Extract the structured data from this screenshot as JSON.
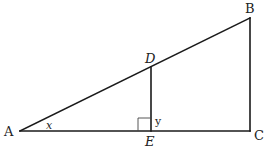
{
  "diagram": {
    "points": {
      "A": {
        "label": "A",
        "x": 20,
        "y": 131
      },
      "B": {
        "label": "B",
        "x": 250,
        "y": 18
      },
      "C": {
        "label": "C",
        "x": 250,
        "y": 131
      },
      "D": {
        "label": "D",
        "x": 151,
        "y": 67
      },
      "E": {
        "label": "E",
        "x": 151,
        "y": 131
      }
    },
    "segments": [
      {
        "from": "A",
        "to": "B"
      },
      {
        "from": "B",
        "to": "C"
      },
      {
        "from": "A",
        "to": "C"
      },
      {
        "from": "D",
        "to": "E"
      }
    ],
    "angles": {
      "x": {
        "label": "x",
        "vertex": "A"
      },
      "y": {
        "label": "y",
        "vertex": "E"
      }
    },
    "right_angle_marks": [
      {
        "vertex": "E"
      }
    ],
    "colors": {
      "line": "#1a1a1a",
      "text": "#222222",
      "background": "#ffffff"
    }
  }
}
